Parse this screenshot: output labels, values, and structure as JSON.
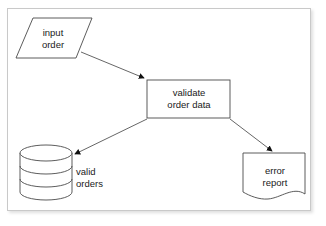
{
  "diagram": {
    "background_color": "#ffffff",
    "frame_border_color": "#c9c9c9",
    "stroke_color": "#444444",
    "text_color": "#1a1a1a",
    "nodes": [
      {
        "id": "input-order",
        "shape": "parallelogram",
        "shape_meaning": "input-output",
        "label_line1": "input",
        "label_line2": "order"
      },
      {
        "id": "validate-order-data",
        "shape": "rectangle",
        "shape_meaning": "process",
        "label_line1": "validate",
        "label_line2": "order data"
      },
      {
        "id": "valid-orders",
        "shape": "cylinder",
        "shape_meaning": "data-store",
        "label_line1": "valid",
        "label_line2": "orders"
      },
      {
        "id": "error-report",
        "shape": "document",
        "shape_meaning": "document",
        "label_line1": "error",
        "label_line2": "report"
      }
    ],
    "edges": [
      {
        "id": "edge-input-to-validate",
        "from": "input-order",
        "to": "validate-order-data",
        "arrowhead": "filled-triangle"
      },
      {
        "id": "edge-validate-to-store",
        "from": "validate-order-data",
        "to": "valid-orders",
        "arrowhead": "filled-triangle"
      },
      {
        "id": "edge-validate-to-report",
        "from": "validate-order-data",
        "to": "error-report",
        "arrowhead": "filled-triangle"
      }
    ]
  }
}
